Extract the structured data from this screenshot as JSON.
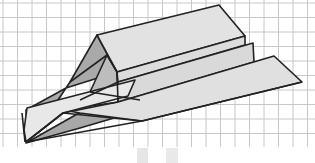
{
  "image": {
    "description": "Line illustration of a folded paper airplane drawn on grid paper",
    "width": 315,
    "height": 163
  },
  "colors": {
    "background": "#ffffff",
    "grid_line": "#c8c8c8",
    "paper_light": "#e4e4e4",
    "paper_mid": "#cfcfcf",
    "paper_shadow": "#a9a9a9",
    "outline": "#222222",
    "smudge": "#e2e2e2"
  },
  "grid": {
    "spacing": 14.5,
    "origin_x": 3,
    "origin_y": 3,
    "bottom_edge_y": 147
  }
}
